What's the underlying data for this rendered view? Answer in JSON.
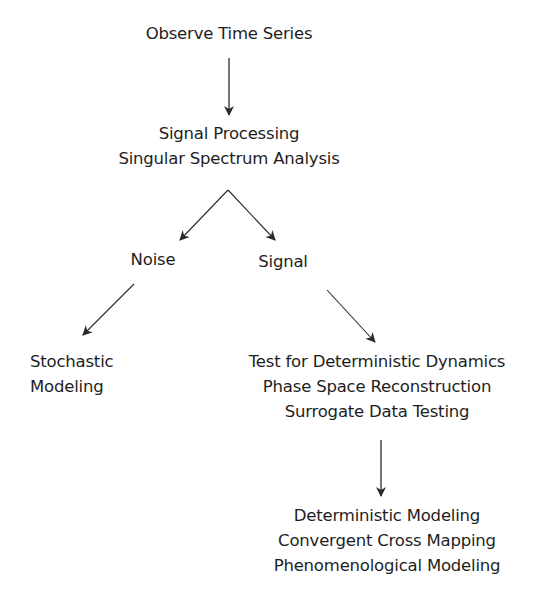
{
  "diagram": {
    "type": "flowchart",
    "nodes": {
      "observe": {
        "lines": [
          "Observe Time Series"
        ]
      },
      "signal_processing": {
        "lines": [
          "Signal Processing",
          "Singular Spectrum Analysis"
        ]
      },
      "noise": {
        "lines": [
          "Noise"
        ]
      },
      "signal": {
        "lines": [
          "Signal"
        ]
      },
      "stochastic": {
        "lines": [
          "Stochastic",
          "Modeling"
        ]
      },
      "test": {
        "lines": [
          "Test for Deterministic Dynamics",
          "Phase Space Reconstruction",
          "Surrogate Data Testing"
        ]
      },
      "modeling": {
        "lines": [
          "Deterministic Modeling",
          "Convergent Cross Mapping",
          "Phenomenological Modeling"
        ]
      }
    },
    "edges": [
      {
        "from": "observe",
        "to": "signal_processing"
      },
      {
        "from": "signal_processing",
        "to": "noise"
      },
      {
        "from": "signal_processing",
        "to": "signal"
      },
      {
        "from": "noise",
        "to": "stochastic"
      },
      {
        "from": "signal",
        "to": "test"
      },
      {
        "from": "test",
        "to": "modeling"
      }
    ],
    "colors": {
      "text": "#1e1e1e",
      "arrow": "#2a2a2a",
      "background": "#ffffff"
    }
  }
}
